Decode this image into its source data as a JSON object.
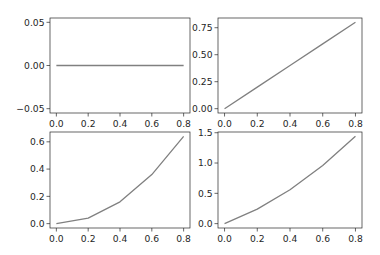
{
  "figure": {
    "width": 380,
    "height": 255,
    "background": "#ffffff",
    "line_color": "#808080",
    "axis_color": "#262626"
  },
  "chart_data": [
    {
      "type": "line",
      "position": "top-left",
      "title": "",
      "xlabel": "",
      "ylabel": "",
      "x": [
        0.0,
        0.2,
        0.4,
        0.6,
        0.8
      ],
      "series": [
        {
          "name": "",
          "values": [
            0,
            0,
            0,
            0,
            0
          ]
        }
      ],
      "xlim": [
        -0.04,
        0.84
      ],
      "ylim": [
        -0.055,
        0.055
      ],
      "xticks": [
        0.0,
        0.2,
        0.4,
        0.6,
        0.8
      ],
      "xtick_labels": [
        "0.0",
        "0.2",
        "0.4",
        "0.6",
        "0.8"
      ],
      "yticks": [
        -0.05,
        0.0,
        0.05
      ],
      "ytick_labels": [
        "−0.05",
        "0.00",
        "0.05"
      ],
      "grid": false,
      "legend": false
    },
    {
      "type": "line",
      "position": "top-right",
      "title": "",
      "xlabel": "",
      "ylabel": "",
      "x": [
        0.0,
        0.2,
        0.4,
        0.6,
        0.8
      ],
      "series": [
        {
          "name": "",
          "values": [
            0.0,
            0.2,
            0.4,
            0.6,
            0.8
          ]
        }
      ],
      "xlim": [
        -0.04,
        0.84
      ],
      "ylim": [
        -0.04,
        0.84
      ],
      "xticks": [
        0.0,
        0.2,
        0.4,
        0.6,
        0.8
      ],
      "xtick_labels": [
        "0.0",
        "0.2",
        "0.4",
        "0.6",
        "0.8"
      ],
      "yticks": [
        0.0,
        0.25,
        0.5,
        0.75
      ],
      "ytick_labels": [
        "0.00",
        "0.25",
        "0.50",
        "0.75"
      ],
      "grid": false,
      "legend": false
    },
    {
      "type": "line",
      "position": "bottom-left",
      "title": "",
      "xlabel": "",
      "ylabel": "",
      "x": [
        0.0,
        0.2,
        0.4,
        0.6,
        0.8
      ],
      "series": [
        {
          "name": "",
          "values": [
            0.0,
            0.04,
            0.16,
            0.36,
            0.64
          ]
        }
      ],
      "xlim": [
        -0.04,
        0.84
      ],
      "ylim": [
        -0.032,
        0.672
      ],
      "xticks": [
        0.0,
        0.2,
        0.4,
        0.6,
        0.8
      ],
      "xtick_labels": [
        "0.0",
        "0.2",
        "0.4",
        "0.6",
        "0.8"
      ],
      "yticks": [
        0.0,
        0.2,
        0.4,
        0.6
      ],
      "ytick_labels": [
        "0.0",
        "0.2",
        "0.4",
        "0.6"
      ],
      "grid": false,
      "legend": false
    },
    {
      "type": "line",
      "position": "bottom-right",
      "title": "",
      "xlabel": "",
      "ylabel": "",
      "x": [
        0.0,
        0.2,
        0.4,
        0.6,
        0.8
      ],
      "series": [
        {
          "name": "",
          "values": [
            0.0,
            0.24,
            0.56,
            0.96,
            1.44
          ]
        }
      ],
      "xlim": [
        -0.04,
        0.84
      ],
      "ylim": [
        -0.072,
        1.512
      ],
      "xticks": [
        0.0,
        0.2,
        0.4,
        0.6,
        0.8
      ],
      "xtick_labels": [
        "0.0",
        "0.2",
        "0.4",
        "0.6",
        "0.8"
      ],
      "yticks": [
        0.0,
        0.5,
        1.0,
        1.5
      ],
      "ytick_labels": [
        "0.0",
        "0.5",
        "1.0",
        "1.5"
      ],
      "grid": false,
      "legend": false
    }
  ],
  "layout": {
    "axes_boxes": [
      {
        "x0": 50,
        "y0": 18,
        "x1": 190,
        "y1": 113
      },
      {
        "x0": 218,
        "y0": 18,
        "x1": 362,
        "y1": 113
      },
      {
        "x0": 50,
        "y0": 132,
        "x1": 190,
        "y1": 228
      },
      {
        "x0": 218,
        "y0": 132,
        "x1": 362,
        "y1": 228
      }
    ]
  }
}
